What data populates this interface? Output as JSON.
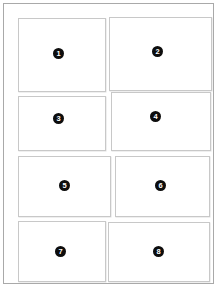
{
  "page": {
    "background_color": "#ffffff",
    "frame_border_color": "#a9a9a9",
    "panel_border_color": "#c8c8c8",
    "badge_color": "#0d0d0d",
    "badge_text_color": "#ffffff"
  },
  "panels": [
    {
      "number": "1"
    },
    {
      "number": "2"
    },
    {
      "number": "3"
    },
    {
      "number": "4"
    },
    {
      "number": "5"
    },
    {
      "number": "6"
    },
    {
      "number": "7"
    },
    {
      "number": "8"
    }
  ]
}
